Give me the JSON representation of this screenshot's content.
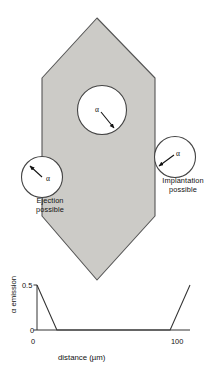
{
  "figure": {
    "crystal": {
      "name": "hexagonal-crystal",
      "fill_color": "#cccbc7",
      "stroke_color": "#4d4d4d"
    },
    "alpha_symbol": "α",
    "recoil_spheres": [
      {
        "id": "interior",
        "label": "α",
        "note": "interior recoil sphere, arrow points inward (down-right)"
      },
      {
        "id": "left-edge",
        "label": "α",
        "note": "recoil sphere straddling left crystal face"
      },
      {
        "id": "right-edge",
        "label": "α",
        "note": "recoil sphere straddling right crystal face"
      }
    ],
    "annotations": {
      "ejection": "Ejection\npossible",
      "ejection_line1": "Ejection",
      "ejection_line2": "possible",
      "implantation_line1": "Implantation",
      "implantation_line2": "possible"
    }
  },
  "chart_data": {
    "type": "line",
    "title": "",
    "xlabel": "distance (µm)",
    "ylabel": "α emission",
    "xlim": [
      0,
      100
    ],
    "ylim": [
      0,
      0.5
    ],
    "xticks": [
      0,
      100
    ],
    "xticklabels": [
      "0",
      "100"
    ],
    "yticks": [
      0,
      0.5
    ],
    "yticklabels": [
      "0",
      "0.5"
    ],
    "grid": false,
    "legend": null,
    "series": [
      {
        "name": "α emission profile",
        "x": [
          0,
          13,
          87,
          100
        ],
        "y": [
          0.5,
          0,
          0,
          0.5
        ],
        "color": "#333333",
        "note": "V-shaped: enhanced emission within recoil distance of each crystal face, zero in the grain interior"
      }
    ]
  }
}
